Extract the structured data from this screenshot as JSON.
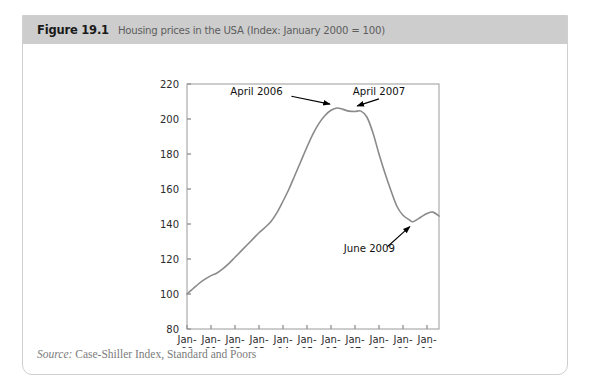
{
  "figure": {
    "number": "Figure 19.1",
    "caption": "Housing prices in the USA (Index: January 2000 = 100)",
    "source_label": "Source:",
    "source_text": " Case-Shiller Index, Standard and Poors",
    "header_bg": "#cdcdcd",
    "card_border": "#cfcfcf"
  },
  "chart_data": {
    "type": "line",
    "title": "Housing prices in the USA (Index: January 2000 = 100)",
    "xlabel": "",
    "ylabel": "",
    "ylim": [
      80,
      220
    ],
    "yticks": [
      80,
      100,
      120,
      140,
      160,
      180,
      200,
      220
    ],
    "xlim": [
      2000.0,
      2010.5
    ],
    "xticks": [
      2000,
      2001,
      2002,
      2003,
      2004,
      2005,
      2006,
      2007,
      2008,
      2009,
      2010
    ],
    "xtick_labels": [
      [
        "Jan-",
        "00"
      ],
      [
        "Jan-",
        "01"
      ],
      [
        "Jan-",
        "02"
      ],
      [
        "Jan-",
        "03"
      ],
      [
        "Jan-",
        "04"
      ],
      [
        "Jan-",
        "05"
      ],
      [
        "Jan-",
        "06"
      ],
      [
        "Jan-",
        "07"
      ],
      [
        "Jan-",
        "08"
      ],
      [
        "Jan-",
        "09"
      ],
      [
        "Jan-",
        "10"
      ]
    ],
    "grid": false,
    "legend": "none",
    "line_color": "#8a8a8a",
    "series": [
      {
        "name": "Case-Shiller US National Home Price Index",
        "x": [
          2000.0,
          2000.25,
          2000.5,
          2000.75,
          2001.0,
          2001.25,
          2001.5,
          2001.75,
          2002.0,
          2002.25,
          2002.5,
          2002.75,
          2003.0,
          2003.25,
          2003.5,
          2003.75,
          2004.0,
          2004.25,
          2004.5,
          2004.75,
          2005.0,
          2005.25,
          2005.5,
          2005.75,
          2006.0,
          2006.25,
          2006.5,
          2006.75,
          2007.0,
          2007.25,
          2007.5,
          2007.75,
          2008.0,
          2008.25,
          2008.5,
          2008.75,
          2009.0,
          2009.25,
          2009.42,
          2009.75,
          2010.0,
          2010.25,
          2010.5
        ],
        "values": [
          100.0,
          103.0,
          106.0,
          108.5,
          110.5,
          112.0,
          114.5,
          117.5,
          121.0,
          124.5,
          128.0,
          131.5,
          135.0,
          138.0,
          141.5,
          146.5,
          153.0,
          160.0,
          168.0,
          176.0,
          184.0,
          191.5,
          197.5,
          202.0,
          205.0,
          206.3,
          205.5,
          204.5,
          204.3,
          204.5,
          201.0,
          192.0,
          180.0,
          169.0,
          159.0,
          150.0,
          145.0,
          142.5,
          141.3,
          144.0,
          146.0,
          146.8,
          144.5
        ]
      }
    ],
    "annotations": [
      {
        "text": "April 2006",
        "point_value": 206.3,
        "point_x": 2006.25,
        "label_x": 2002.9,
        "label_y": 214.0,
        "arrow_from_x": 2004.35,
        "arrow_from_y": 213.0,
        "arrow_to_x": 2005.95,
        "arrow_to_y": 208.5
      },
      {
        "text": "April 2007",
        "point_value": 204.3,
        "point_x": 2007.0,
        "label_x": 2008.0,
        "label_y": 214.0,
        "arrow_from_x": 2008.0,
        "arrow_from_y": 211.5,
        "arrow_to_x": 2007.1,
        "arrow_to_y": 207.5
      },
      {
        "text": "June 2009",
        "point_value": 141.3,
        "point_x": 2009.42,
        "label_x": 2007.6,
        "label_y": 124.0,
        "arrow_from_x": 2008.35,
        "arrow_from_y": 127.0,
        "arrow_to_x": 2009.28,
        "arrow_to_y": 138.5
      }
    ]
  }
}
